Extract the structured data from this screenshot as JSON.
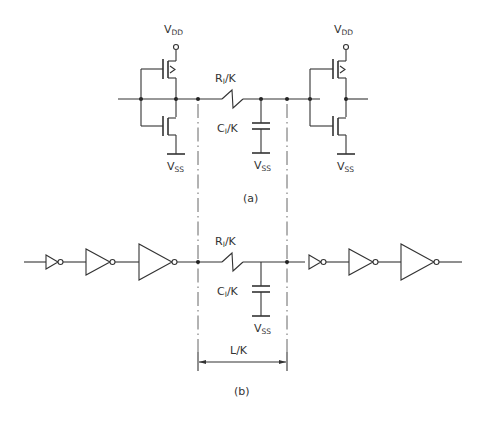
{
  "figure": {
    "part_a": {
      "caption": "(a)",
      "left_inverter": {
        "supply_top": {
          "main": "V",
          "sub": "DD"
        },
        "supply_bottom": {
          "main": "V",
          "sub": "SS"
        }
      },
      "right_inverter": {
        "supply_top": {
          "main": "V",
          "sub": "DD"
        },
        "supply_bottom": {
          "main": "V",
          "sub": "SS"
        }
      },
      "resistor": {
        "main": "R",
        "sub": "I",
        "suffix": "/K"
      },
      "capacitor": {
        "main": "C",
        "sub": "I",
        "suffix": "/K"
      },
      "cap_ground": {
        "main": "V",
        "sub": "SS"
      }
    },
    "part_b": {
      "caption": "(b)",
      "left_buffer_chain": {
        "stages": 3
      },
      "right_buffer_chain": {
        "stages": 3
      },
      "resistor": {
        "main": "R",
        "sub": "I",
        "suffix": "/K"
      },
      "capacitor": {
        "main": "C",
        "sub": "I",
        "suffix": "/K"
      },
      "cap_ground": {
        "main": "V",
        "sub": "SS"
      },
      "dimension": {
        "label": "L/K"
      }
    }
  },
  "colors": {
    "line": "#333333",
    "background": "#ffffff",
    "dash": "#555555"
  }
}
